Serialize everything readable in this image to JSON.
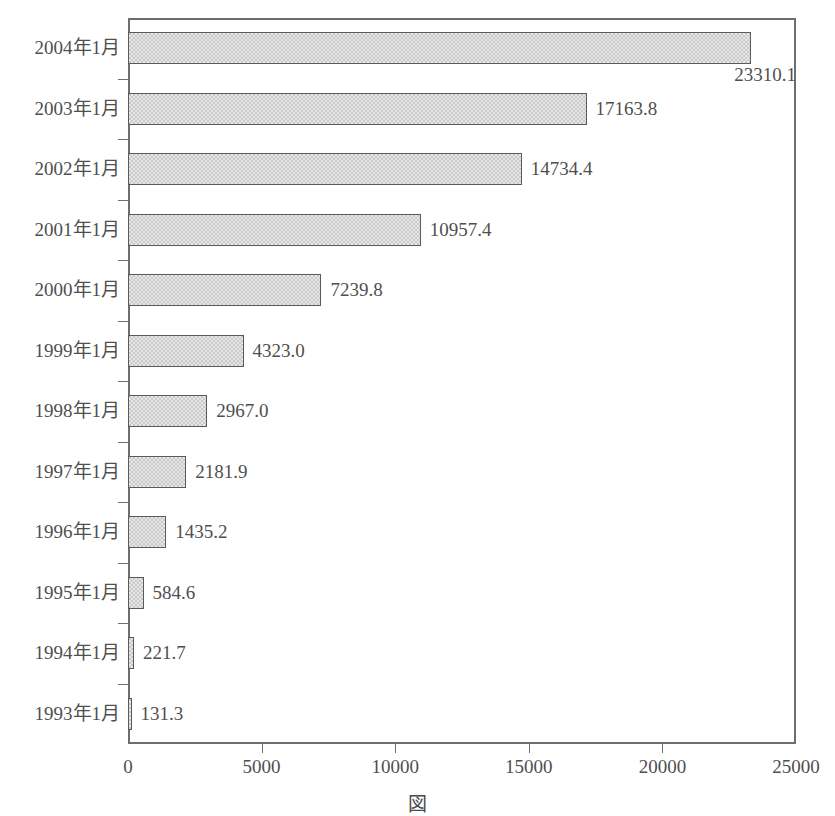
{
  "chart_data": {
    "type": "bar",
    "orientation": "horizontal",
    "title": "",
    "subtitle": "",
    "xlabel": "",
    "ylabel": "",
    "xlim": [
      0,
      25000
    ],
    "xticks": [
      "0",
      "5000",
      "10000",
      "15000",
      "20000",
      "25000"
    ],
    "xtick_values": [
      0,
      5000,
      10000,
      15000,
      20000,
      25000
    ],
    "grid": false,
    "legend": "none",
    "categories": [
      "2004年1月",
      "2003年1月",
      "2002年1月",
      "2001年1月",
      "2000年1月",
      "1999年1月",
      "1998年1月",
      "1997年1月",
      "1996年1月",
      "1995年1月",
      "1994年1月",
      "1993年1月"
    ],
    "values": [
      23310.1,
      17163.8,
      14734.4,
      10957.4,
      7239.8,
      4323.0,
      2967.0,
      2181.9,
      1435.2,
      584.6,
      221.7,
      131.3
    ],
    "value_labels": [
      "23310.1",
      "17163.8",
      "14734.4",
      "10957.4",
      "7239.8",
      "4323.0",
      "2967.0",
      "2181.9",
      "1435.2",
      "584.6",
      "221.7",
      "131.3"
    ],
    "label_placement": [
      "below-right",
      "right",
      "right",
      "right",
      "right",
      "right",
      "right",
      "right",
      "right",
      "right",
      "right",
      "right"
    ],
    "bar_fill_color": "#c9c9c9",
    "bar_border_color": "#5a5a5a",
    "axis_color": "#6e6e6e",
    "text_color": "#4f4f4f",
    "background_color": "#ffffff"
  },
  "caption": {
    "text": "図"
  }
}
